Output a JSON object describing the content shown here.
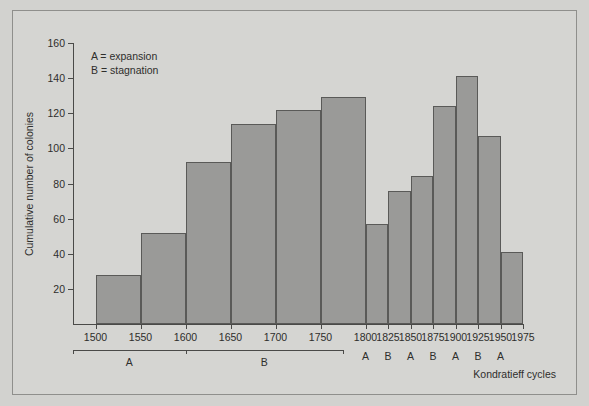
{
  "chart_data": {
    "type": "bar",
    "title": "",
    "xlabel": "Kondratieff cycles",
    "ylabel": "Cumulative number of colonies",
    "categories": [
      "1500",
      "1550",
      "1600",
      "1650",
      "1700",
      "1750",
      "1800",
      "1825",
      "1850",
      "1875",
      "1900",
      "1925",
      "1950"
    ],
    "values": [
      28,
      52,
      92,
      114,
      122,
      129,
      57,
      76,
      84,
      124,
      141,
      107,
      41
    ],
    "bar_spans": [
      {
        "start": "1500",
        "end": "1550",
        "value": 28
      },
      {
        "start": "1550",
        "end": "1600",
        "value": 52
      },
      {
        "start": "1600",
        "end": "1650",
        "value": 92
      },
      {
        "start": "1650",
        "end": "1700",
        "value": 114
      },
      {
        "start": "1700",
        "end": "1750",
        "value": 122
      },
      {
        "start": "1750",
        "end": "1800",
        "value": 129
      },
      {
        "start": "1800",
        "end": "1825",
        "value": 57
      },
      {
        "start": "1825",
        "end": "1850",
        "value": 76
      },
      {
        "start": "1850",
        "end": "1875",
        "value": 84
      },
      {
        "start": "1875",
        "end": "1900",
        "value": 124
      },
      {
        "start": "1900",
        "end": "1925",
        "value": 141
      },
      {
        "start": "1925",
        "end": "1950",
        "value": 107
      },
      {
        "start": "1950",
        "end": "1975",
        "value": 41
      }
    ],
    "xticks": [
      "1500",
      "1550",
      "1600",
      "1650",
      "1700",
      "1750",
      "1800",
      "1825",
      "1850",
      "1875",
      "1900",
      "1925",
      "1950",
      "1975"
    ],
    "yticks": [
      20,
      40,
      60,
      80,
      100,
      120,
      140,
      160
    ],
    "ylim": [
      0,
      160
    ],
    "grid": false,
    "legend_position": "top-left",
    "bar_color": "#9a9a98",
    "axis_color": "#4a4a48",
    "background_color": "#d5d5d2"
  },
  "legend": {
    "line1": "A = expansion",
    "line2": "B = stagnation"
  },
  "cycle_markers": {
    "brackets": [
      {
        "label": "A",
        "from": "1475",
        "to": "1600"
      },
      {
        "label": "B",
        "from": "1600",
        "to": "1775"
      }
    ],
    "letters": [
      {
        "label": "A",
        "at": "1800"
      },
      {
        "label": "B",
        "at": "1825"
      },
      {
        "label": "A",
        "at": "1850"
      },
      {
        "label": "B",
        "at": "1875"
      },
      {
        "label": "A",
        "at": "1900"
      },
      {
        "label": "B",
        "at": "1925"
      },
      {
        "label": "A",
        "at": "1950"
      }
    ]
  }
}
